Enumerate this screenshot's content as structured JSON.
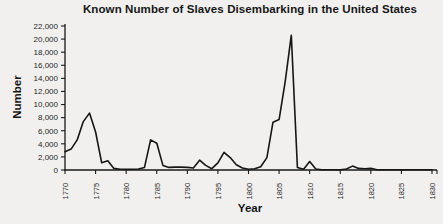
{
  "chart_data": {
    "type": "line",
    "title": "Known Number of Slaves Disembarking in the United States",
    "xlabel": "Year",
    "ylabel": "Number",
    "xlim": [
      1770,
      1830
    ],
    "ylim": [
      0,
      22000
    ],
    "grid": false,
    "legend": "none",
    "line_color": "#161616",
    "axis_color": "#1a1a1a",
    "background_color": "#f1f0ee",
    "x_ticks": [
      1770,
      1775,
      1780,
      1785,
      1790,
      1795,
      1800,
      1805,
      1810,
      1815,
      1820,
      1825,
      1830
    ],
    "y_ticks": [
      0,
      2000,
      4000,
      6000,
      8000,
      10000,
      12000,
      14000,
      16000,
      18000,
      20000,
      22000
    ],
    "y_tick_labels": [
      "0",
      "2,000",
      "4,000",
      "6,000",
      "8,000",
      "10,000",
      "12,000",
      "14,000",
      "16,000",
      "18,000",
      "20,000",
      "22,000"
    ],
    "series": {
      "x": [
        1770,
        1771,
        1772,
        1773,
        1774,
        1775,
        1776,
        1777,
        1778,
        1779,
        1780,
        1781,
        1782,
        1783,
        1784,
        1785,
        1786,
        1787,
        1788,
        1789,
        1790,
        1791,
        1792,
        1793,
        1794,
        1795,
        1796,
        1797,
        1798,
        1799,
        1800,
        1801,
        1802,
        1803,
        1804,
        1805,
        1806,
        1807,
        1808,
        1809,
        1810,
        1811,
        1812,
        1813,
        1814,
        1815,
        1816,
        1817,
        1818,
        1819,
        1820,
        1821,
        1822,
        1823,
        1824,
        1825,
        1826,
        1827,
        1828,
        1829,
        1830
      ],
      "y": [
        2800,
        3200,
        4600,
        7400,
        8700,
        5800,
        1100,
        1400,
        250,
        100,
        100,
        100,
        150,
        400,
        4600,
        4100,
        700,
        400,
        450,
        450,
        400,
        300,
        1500,
        700,
        200,
        1100,
        2700,
        1900,
        800,
        300,
        100,
        200,
        500,
        1900,
        7300,
        7700,
        13500,
        20600,
        400,
        100,
        1300,
        150,
        50,
        50,
        50,
        50,
        150,
        600,
        250,
        200,
        250,
        50,
        30,
        30,
        30,
        30,
        30,
        30,
        30,
        30,
        30
      ]
    }
  }
}
